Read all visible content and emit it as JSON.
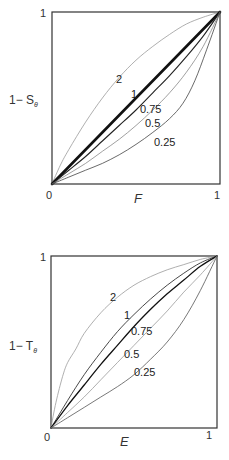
{
  "panels": [
    {
      "id": "top",
      "box": {
        "x": 52,
        "y": 12,
        "w": 168,
        "h": 172
      },
      "x_axis": {
        "label": "F",
        "ticks": [
          "0",
          "1"
        ]
      },
      "y_axis": {
        "label_main": "1− S",
        "label_sub": "θ",
        "ticks": [
          "1"
        ]
      },
      "curves": [
        {
          "label": "2",
          "color": "#9a9a9a",
          "width": 0.8,
          "points": [
            [
              0,
              0
            ],
            [
              0.05,
              0.11
            ],
            [
              0.1,
              0.2
            ],
            [
              0.2,
              0.36
            ],
            [
              0.3,
              0.5
            ],
            [
              0.4,
              0.62
            ],
            [
              0.5,
              0.72
            ],
            [
              0.6,
              0.8
            ],
            [
              0.7,
              0.87
            ],
            [
              0.8,
              0.93
            ],
            [
              0.9,
              0.97
            ],
            [
              1,
              1
            ]
          ],
          "label_pos": [
            116,
            83
          ]
        },
        {
          "label": "1",
          "color": "#111111",
          "width": 2.6,
          "points": [
            [
              0,
              0
            ],
            [
              1,
              1
            ]
          ],
          "label_pos": [
            131,
            98
          ]
        },
        {
          "label": "0.75",
          "color": "#222222",
          "width": 1.1,
          "points": [
            [
              0,
              0
            ],
            [
              0.1,
              0.08
            ],
            [
              0.2,
              0.16
            ],
            [
              0.3,
              0.25
            ],
            [
              0.4,
              0.34
            ],
            [
              0.5,
              0.43
            ],
            [
              0.6,
              0.53
            ],
            [
              0.7,
              0.63
            ],
            [
              0.8,
              0.74
            ],
            [
              0.9,
              0.86
            ],
            [
              1,
              1
            ]
          ],
          "label_pos": [
            140,
            113
          ]
        },
        {
          "label": "0.5",
          "color": "#888888",
          "width": 0.8,
          "points": [
            [
              0,
              0
            ],
            [
              0.1,
              0.06
            ],
            [
              0.2,
              0.12
            ],
            [
              0.3,
              0.19
            ],
            [
              0.4,
              0.26
            ],
            [
              0.5,
              0.34
            ],
            [
              0.6,
              0.43
            ],
            [
              0.7,
              0.53
            ],
            [
              0.8,
              0.65
            ],
            [
              0.9,
              0.8
            ],
            [
              1,
              1
            ]
          ],
          "label_pos": [
            145,
            127
          ]
        },
        {
          "label": "0.25",
          "color": "#444444",
          "width": 0.8,
          "points": [
            [
              0,
              0
            ],
            [
              0.1,
              0.04
            ],
            [
              0.2,
              0.08
            ],
            [
              0.3,
              0.12
            ],
            [
              0.4,
              0.17
            ],
            [
              0.5,
              0.23
            ],
            [
              0.6,
              0.3
            ],
            [
              0.7,
              0.38
            ],
            [
              0.78,
              0.47
            ],
            [
              0.85,
              0.6
            ],
            [
              0.92,
              0.78
            ],
            [
              1,
              1
            ]
          ],
          "label_pos": [
            154,
            146
          ]
        }
      ]
    },
    {
      "id": "bottom",
      "box": {
        "x": 51,
        "y": 256,
        "w": 166,
        "h": 172
      },
      "x_axis": {
        "label": "E",
        "ticks": [
          "0",
          "1"
        ]
      },
      "y_axis": {
        "label_main": "1− T",
        "label_sub": "θ",
        "ticks": [
          "1"
        ]
      },
      "curves": [
        {
          "label": "2",
          "color": "#9a9a9a",
          "width": 0.8,
          "points": [
            [
              0,
              0
            ],
            [
              0.03,
              0.15
            ],
            [
              0.07,
              0.3
            ],
            [
              0.1,
              0.38
            ],
            [
              0.15,
              0.46
            ],
            [
              0.2,
              0.55
            ],
            [
              0.3,
              0.67
            ],
            [
              0.4,
              0.76
            ],
            [
              0.5,
              0.83
            ],
            [
              0.6,
              0.88
            ],
            [
              0.7,
              0.92
            ],
            [
              0.8,
              0.95
            ],
            [
              0.9,
              0.98
            ],
            [
              1,
              1
            ]
          ],
          "label_pos": [
            110,
            301
          ]
        },
        {
          "label": "1",
          "color": "#333333",
          "width": 0.9,
          "points": [
            [
              0,
              0
            ],
            [
              0.1,
              0.16
            ],
            [
              0.2,
              0.31
            ],
            [
              0.3,
              0.44
            ],
            [
              0.4,
              0.56
            ],
            [
              0.5,
              0.66
            ],
            [
              0.6,
              0.75
            ],
            [
              0.7,
              0.83
            ],
            [
              0.8,
              0.9
            ],
            [
              0.9,
              0.96
            ],
            [
              1,
              1
            ]
          ],
          "label_pos": [
            124,
            319
          ]
        },
        {
          "label": "0.75",
          "color": "#111111",
          "width": 1.3,
          "points": [
            [
              0,
              0
            ],
            [
              0.1,
              0.13
            ],
            [
              0.2,
              0.25
            ],
            [
              0.3,
              0.37
            ],
            [
              0.4,
              0.48
            ],
            [
              0.5,
              0.59
            ],
            [
              0.6,
              0.69
            ],
            [
              0.7,
              0.78
            ],
            [
              0.8,
              0.86
            ],
            [
              0.9,
              0.94
            ],
            [
              1,
              1
            ]
          ],
          "label_pos": [
            131,
            335
          ]
        },
        {
          "label": "0.5",
          "color": "#999999",
          "width": 0.8,
          "points": [
            [
              0,
              0
            ],
            [
              0.1,
              0.09
            ],
            [
              0.2,
              0.18
            ],
            [
              0.3,
              0.28
            ],
            [
              0.4,
              0.38
            ],
            [
              0.5,
              0.48
            ],
            [
              0.6,
              0.58
            ],
            [
              0.7,
              0.68
            ],
            [
              0.8,
              0.79
            ],
            [
              0.9,
              0.89
            ],
            [
              1,
              1
            ]
          ],
          "label_pos": [
            124,
            358
          ]
        },
        {
          "label": "0.25",
          "color": "#555555",
          "width": 0.8,
          "points": [
            [
              0,
              0
            ],
            [
              0.1,
              0.06
            ],
            [
              0.2,
              0.12
            ],
            [
              0.3,
              0.18
            ],
            [
              0.4,
              0.24
            ],
            [
              0.5,
              0.31
            ],
            [
              0.6,
              0.4
            ],
            [
              0.7,
              0.5
            ],
            [
              0.8,
              0.63
            ],
            [
              0.9,
              0.8
            ],
            [
              1,
              1
            ]
          ],
          "label_pos": [
            134,
            376
          ]
        }
      ]
    }
  ]
}
